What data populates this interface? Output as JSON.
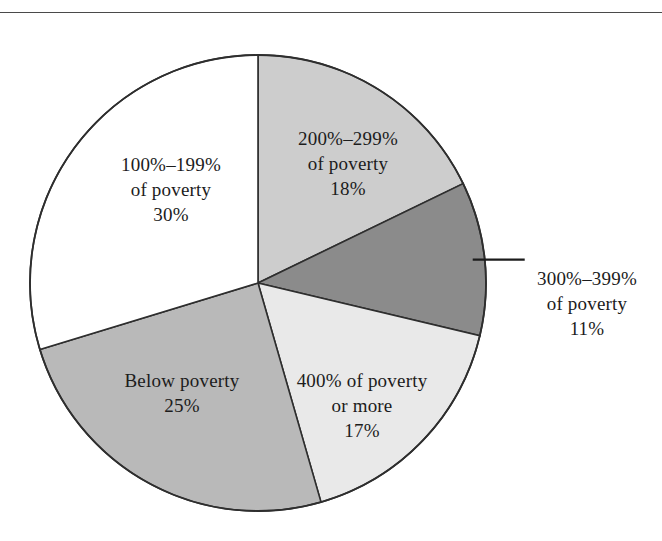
{
  "figure": {
    "has_top_rule": true,
    "background_color": "#ffffff",
    "outline_color": "#2e2e2e"
  },
  "chart_data": {
    "type": "pie",
    "title": "",
    "subtitle": "",
    "xlabel": "",
    "ylabel": "",
    "legend_position": "none",
    "grid": false,
    "units": "percent",
    "start_angle_deg": 0,
    "direction": "clockwise",
    "categories": [
      "200%–299% of poverty",
      "300%–399% of poverty",
      "400% of poverty or more",
      "Below poverty",
      "100%–199% of poverty"
    ],
    "values": [
      18,
      11,
      17,
      25,
      30
    ],
    "slices": [
      {
        "id": "slice-200-299",
        "name": "200%–299% of poverty",
        "value": 18,
        "value_label": "18%",
        "color": "#cdcdcd",
        "label_line1": "200%–299%",
        "label_line2": "of poverty",
        "label_line3": "18%",
        "label_placement": "inside"
      },
      {
        "id": "slice-300-399",
        "name": "300%–399% of poverty",
        "value": 11,
        "value_label": "11%",
        "color": "#8b8b8b",
        "label_line1": "300%–399%",
        "label_line2": "of poverty",
        "label_line3": "11%",
        "label_placement": "outside",
        "has_leader_line": true
      },
      {
        "id": "slice-400-plus",
        "name": "400% of poverty or more",
        "value": 17,
        "value_label": "17%",
        "color": "#e9e9e9",
        "label_line1": "400% of poverty",
        "label_line2": "or more",
        "label_line3": "17%",
        "label_placement": "inside"
      },
      {
        "id": "slice-below-poverty",
        "name": "Below poverty",
        "value": 25,
        "value_label": "25%",
        "color": "#b9b9b9",
        "label_line1": "Below poverty",
        "label_line2": "25%",
        "label_line3": "",
        "label_placement": "inside"
      },
      {
        "id": "slice-100-199",
        "name": "100%–199% of poverty",
        "value": 30,
        "value_label": "30%",
        "color": "#ffffff",
        "label_line1": "100%–199%",
        "label_line2": "of poverty",
        "label_line3": "30%",
        "label_placement": "inside"
      }
    ]
  }
}
